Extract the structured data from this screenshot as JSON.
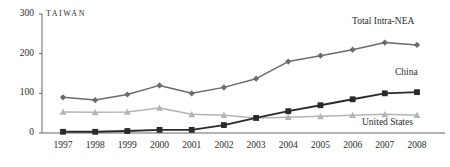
{
  "region_title": "TAIWAN",
  "colors": {
    "total_intra_nea": "#6b6b6b",
    "china": "#2a2a2a",
    "united_states": "#b4b4b4",
    "axis": "#555555",
    "text": "#2b2b2b",
    "background": "#ffffff"
  },
  "axis": {
    "y_ticks": [
      "0",
      "100",
      "200",
      "300"
    ],
    "x_ticks": [
      "1997",
      "1998",
      "1999",
      "2000",
      "2001",
      "2002",
      "2003",
      "2004",
      "2005",
      "2006",
      "2007",
      "2008"
    ]
  },
  "series_labels": {
    "total": "Total Intra-NEA",
    "china": "China",
    "united_states": "United States"
  },
  "chart_data": {
    "type": "line",
    "title": "TAIWAN",
    "xlabel": "",
    "ylabel": "",
    "grid": false,
    "legend_position": "inline-right",
    "ylim": [
      0,
      300
    ],
    "yticks": [
      0,
      100,
      200,
      300
    ],
    "x": [
      "1997",
      "1998",
      "1999",
      "2000",
      "2001",
      "2002",
      "2003",
      "2004",
      "2005",
      "2006",
      "2007",
      "2008"
    ],
    "series": [
      {
        "name": "Total Intra-NEA",
        "marker": "diamond",
        "color": "#6b6b6b",
        "values": [
          90,
          83,
          97,
          120,
          100,
          115,
          137,
          180,
          195,
          210,
          228,
          222
        ]
      },
      {
        "name": "China",
        "marker": "square",
        "color": "#2a2a2a",
        "values": [
          3,
          3,
          5,
          8,
          8,
          20,
          38,
          55,
          70,
          85,
          100,
          103
        ]
      },
      {
        "name": "United States",
        "marker": "triangle",
        "color": "#b4b4b4",
        "values": [
          53,
          52,
          53,
          63,
          47,
          45,
          38,
          40,
          42,
          45,
          47,
          45
        ]
      }
    ]
  }
}
